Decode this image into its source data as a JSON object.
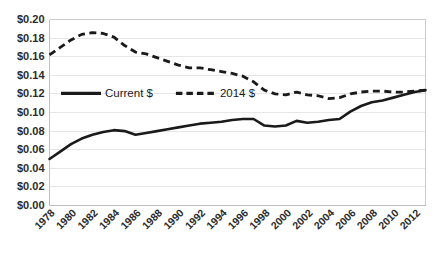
{
  "chart_data": {
    "type": "line",
    "title": "",
    "subtitle": "",
    "xlabel": "",
    "ylabel": "",
    "ylim": [
      0.0,
      0.2
    ],
    "ytick_step": 0.02,
    "ytick_labels": [
      "$0.00",
      "$0.02",
      "$0.04",
      "$0.06",
      "$0.08",
      "$0.10",
      "$0.12",
      "$0.14",
      "$0.16",
      "$0.18",
      "$0.20"
    ],
    "ytick_values": [
      0.0,
      0.02,
      0.04,
      0.06,
      0.08,
      0.1,
      0.12,
      0.14,
      0.16,
      0.18,
      0.2
    ],
    "grid": true,
    "grid_axis": "y",
    "legend_position": "inside-upper-left",
    "xtick_labels": [
      "1978",
      "1980",
      "1982",
      "1984",
      "1986",
      "1988",
      "1990",
      "1992",
      "1994",
      "1996",
      "1998",
      "2000",
      "2002",
      "2004",
      "2006",
      "2008",
      "2010",
      "2012"
    ],
    "xtick_rotation_deg": 45,
    "x": [
      1978,
      1979,
      1980,
      1981,
      1982,
      1983,
      1984,
      1985,
      1986,
      1987,
      1988,
      1989,
      1990,
      1991,
      1992,
      1993,
      1994,
      1995,
      1996,
      1997,
      1998,
      1999,
      2000,
      2001,
      2002,
      2003,
      2004,
      2005,
      2006,
      2007,
      2008,
      2009,
      2010,
      2011,
      2012,
      2013
    ],
    "series": [
      {
        "name": "Current $",
        "line_style": "solid",
        "color": "#1a1a1a",
        "values": [
          0.05,
          0.058,
          0.066,
          0.072,
          0.076,
          0.079,
          0.081,
          0.08,
          0.076,
          0.078,
          0.08,
          0.082,
          0.084,
          0.086,
          0.088,
          0.089,
          0.09,
          0.092,
          0.093,
          0.093,
          0.086,
          0.085,
          0.086,
          0.091,
          0.089,
          0.09,
          0.092,
          0.093,
          0.101,
          0.107,
          0.111,
          0.113,
          0.116,
          0.119,
          0.122,
          0.124
        ]
      },
      {
        "name": "2014 $",
        "line_style": "dashed",
        "color": "#1a1a1a",
        "values": [
          0.162,
          0.17,
          0.178,
          0.184,
          0.186,
          0.185,
          0.181,
          0.172,
          0.165,
          0.163,
          0.159,
          0.155,
          0.151,
          0.148,
          0.148,
          0.146,
          0.144,
          0.142,
          0.139,
          0.133,
          0.124,
          0.12,
          0.119,
          0.122,
          0.119,
          0.118,
          0.115,
          0.116,
          0.12,
          0.122,
          0.123,
          0.123,
          0.122,
          0.122,
          0.123,
          0.124
        ]
      }
    ]
  },
  "legend": {
    "items": [
      {
        "label": "Current $",
        "style": "solid"
      },
      {
        "label": "2014 $",
        "style": "dashed"
      }
    ]
  }
}
